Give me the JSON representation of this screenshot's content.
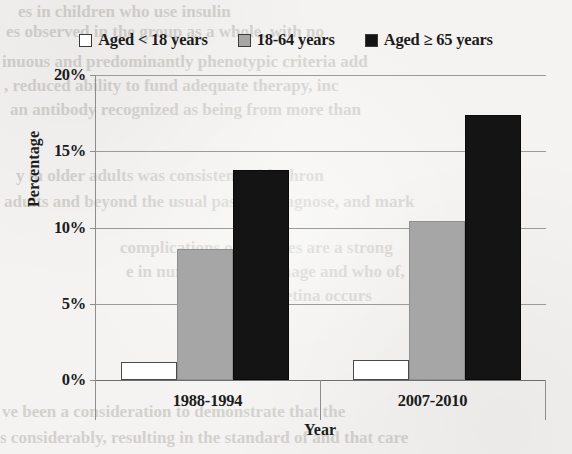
{
  "chart_data": {
    "type": "bar",
    "title": "",
    "subtitle": "",
    "xlabel": "Year",
    "ylabel": "Percentage",
    "categories": [
      "1988-1994",
      "2007-2010"
    ],
    "series": [
      {
        "name": "Aged < 18 years",
        "values": [
          1.2,
          1.3
        ],
        "color": "#ffffff",
        "swatch_style": "white-outline"
      },
      {
        "name": "18-64 years",
        "values": [
          8.6,
          10.4
        ],
        "color": "#a6a6a6",
        "swatch_style": "gray"
      },
      {
        "name": "Aged ≥ 65 years",
        "values": [
          13.8,
          17.4
        ],
        "color": "#141414",
        "swatch_style": "black"
      }
    ],
    "ylim": [
      0,
      20
    ],
    "ytick_values": [
      0,
      5,
      10,
      15,
      20
    ],
    "ytick_labels": [
      "0%",
      "5%",
      "10%",
      "15%",
      "20%"
    ],
    "grid": true,
    "grid_axis": "y",
    "legend_position": "top",
    "value_format": "percent"
  },
  "legend": {
    "entries": [
      {
        "label": "Aged < 18 years"
      },
      {
        "label": "18-64 years"
      },
      {
        "label": "Aged ≥ 65 years"
      }
    ]
  },
  "axes": {
    "y_title": "Percentage",
    "x_title": "Year"
  },
  "background_text": {
    "lines": [
      "es in children who use insulin",
      "es observed in the group as a whole, with no",
      "inuous and predominantly phenotypic criteria add",
      ", reduced ability to fund adequate therapy, inc",
      "an antibody recognized as being from more than",
      "y in older adults was consistent with chron",
      "adults and beyond the usual passage diagnose, and mark",
      "complications of diabetes are a strong",
      "e in numbers who manage and who of, in a",
      "tabes to the retina occurs",
      "ve been a consideration to demonstrate that the",
      "s considerably, resulting in the standard of and that care"
    ]
  }
}
